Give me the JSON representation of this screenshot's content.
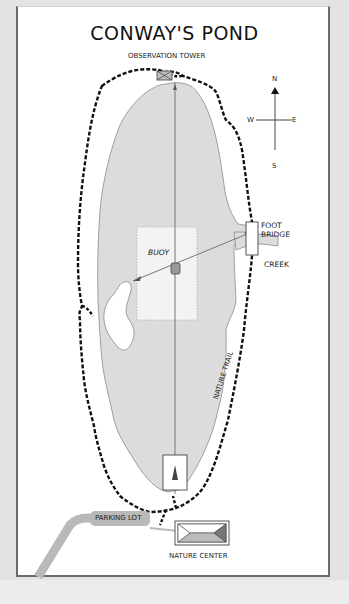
{
  "map": {
    "title": "CONWAY'S POND",
    "labels": {
      "observation_tower": "OBSERVATION TOWER",
      "buoy": "BUOY",
      "foot_bridge_line1": "FOOT",
      "foot_bridge_line2": "BRIDGE",
      "creek": "CREEK",
      "nature_trail": "NATURE TRAIL",
      "parking_lot": "PARKING LOT",
      "nature_center": "NATURE CENTER"
    },
    "compass": {
      "north": "N",
      "south": "S",
      "east": "E",
      "west": "W"
    },
    "colors": {
      "pond": "#dcdcdc",
      "pond_outline": "#8a8a8a",
      "trail": "#111111",
      "road": "#b9b9b9",
      "buoy_area": "#f3f3f3",
      "background": "#e3e3e3",
      "panel": "#ffffff"
    }
  }
}
